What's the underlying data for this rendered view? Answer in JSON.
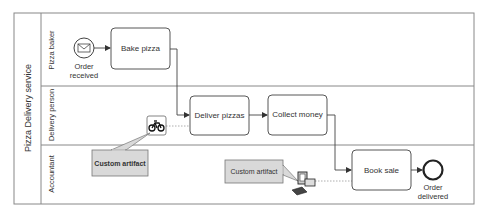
{
  "pool": {
    "label": "Pizza Delivery service"
  },
  "lanes": [
    {
      "label": "Pizza baker"
    },
    {
      "label": "Delivery person"
    },
    {
      "label": "Accountant"
    }
  ],
  "events": {
    "start": {
      "label_line1": "Order",
      "label_line2": "received",
      "icon": "envelope-icon"
    },
    "end": {
      "label_line1": "Order",
      "label_line2": "delivered"
    }
  },
  "tasks": [
    {
      "label": "Bake pizza"
    },
    {
      "label": "Deliver pizzas"
    },
    {
      "label": "Collect money"
    },
    {
      "label": "Book sale"
    }
  ],
  "artifacts": [
    {
      "label": "Custom artifact",
      "icon": "bicycle-icon"
    },
    {
      "label": "Custom artifact",
      "icon": "computer-icon"
    }
  ],
  "colors": {
    "stroke": "#555555",
    "lane_border": "#888888",
    "artifact_fill": "#d9d9d9",
    "text": "#333333"
  }
}
